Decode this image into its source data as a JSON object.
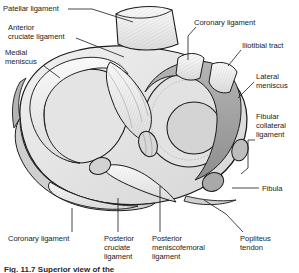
{
  "figure": {
    "caption": "Fig. 11.7  Superior view of the",
    "colors": {
      "background": "#ffffff",
      "outline": "#1b1b1b",
      "bone_fill": "#e8e8e8",
      "cartilage_fill": "#dcdcdc",
      "meniscus_fill": "#c2c2c2",
      "shadow_fill": "#9a9a9a",
      "ligament_fill": "#f2f2f2",
      "label_text": "#1b1b1b",
      "leader_line": "#1b1b1b"
    }
  },
  "labels": [
    {
      "id": "patellar-ligament",
      "text": "Patellar ligament",
      "x": 3,
      "y": 4,
      "align": "left"
    },
    {
      "id": "anterior-cruciate",
      "text": "Anterior\ncruciate ligament",
      "x": 8,
      "y": 23,
      "align": "left"
    },
    {
      "id": "medial-meniscus",
      "text": "Medial\nmeniscus",
      "x": 5,
      "y": 48,
      "align": "left"
    },
    {
      "id": "coronary-ligament-top",
      "text": "Coronary ligament",
      "x": 194,
      "y": 18,
      "align": "left"
    },
    {
      "id": "iliotibial-tract",
      "text": "Iliotibial tract",
      "x": 242,
      "y": 41,
      "align": "left"
    },
    {
      "id": "lateral-meniscus",
      "text": "Lateral\nmeniscus",
      "x": 256,
      "y": 72,
      "align": "left"
    },
    {
      "id": "fibular-collateral",
      "text": "Fibular\ncollateral\nligament",
      "x": 256,
      "y": 112,
      "align": "left"
    },
    {
      "id": "fibula",
      "text": "Fibula",
      "x": 262,
      "y": 184,
      "align": "left"
    },
    {
      "id": "coronary-ligament-bottom",
      "text": "Coronary ligament",
      "x": 8,
      "y": 234,
      "align": "left"
    },
    {
      "id": "posterior-cruciate",
      "text": "Posterior\ncruciate\nligament",
      "x": 104,
      "y": 234,
      "align": "left"
    },
    {
      "id": "posterior-meniscofemoral",
      "text": "Posterior\nmeniscofemoral\nligament",
      "x": 152,
      "y": 234,
      "align": "left"
    },
    {
      "id": "popliteus-tendon",
      "text": "Popliteus\ntendon",
      "x": 240,
      "y": 234,
      "align": "left"
    }
  ],
  "leaders": [
    {
      "id": "leader-patellar-ligament",
      "d": "M 68,9 L 92,9 L 133,22"
    },
    {
      "id": "leader-anterior-cruciate",
      "d": "M 76,38 L 124,57"
    },
    {
      "id": "leader-medial-meniscus",
      "d": "M 44,66 L 60,78"
    },
    {
      "id": "leader-coronary-ligament-top",
      "d": "M 196,27 L 188,36 L 188,60"
    },
    {
      "id": "leader-iliotibial-tract",
      "d": "M 241,50 L 228,66"
    },
    {
      "id": "leader-lateral-meniscus",
      "d": "M 254,82 L 238,98"
    },
    {
      "id": "leader-fibular-collateral",
      "d": "M 255,140 L 248,140 L 248,168 L 241,174"
    },
    {
      "id": "leader-fibula",
      "d": "M 232,188 L 259,188"
    },
    {
      "id": "leader-coronary-ligament-bottom",
      "d": "M 72,232 L 72,208"
    },
    {
      "id": "leader-posterior-cruciate",
      "d": "M 118,232 L 118,198"
    },
    {
      "id": "leader-posterior-meniscofemoral",
      "d": "M 160,232 L 160,186"
    },
    {
      "id": "leader-popliteus-tendon",
      "d": "M 243,232 L 226,214 L 204,200"
    }
  ]
}
